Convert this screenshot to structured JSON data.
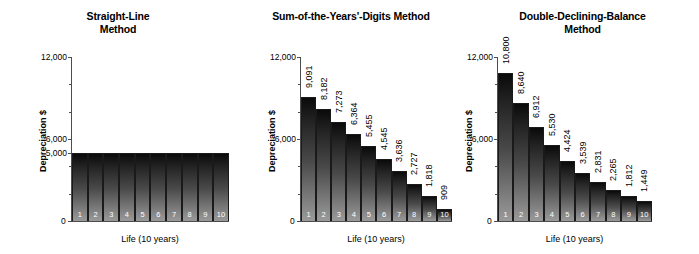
{
  "figure": {
    "panels": [
      {
        "title": "Straight-Line\nMethod",
        "ylabel": "Depreciation $",
        "xlabel": "Life (10 years)",
        "ytick_labels": [
          "12,000",
          "6,000",
          "5,000",
          "0"
        ],
        "zero_label": "0",
        "bar_labels": [
          "1",
          "2",
          "3",
          "4",
          "5",
          "6",
          "7",
          "8",
          "9",
          "10"
        ],
        "show_value_labels": false,
        "values_text": []
      },
      {
        "title": "Sum-of-the-Years'-Digits Method",
        "ylabel": "Depreciation $",
        "xlabel": "Life (10 years)",
        "ytick_labels": [
          "12,000",
          "6,000",
          "0"
        ],
        "zero_label": "0",
        "bar_labels": [
          "1",
          "2",
          "3",
          "4",
          "5",
          "6",
          "7",
          "8",
          "9",
          "10"
        ],
        "show_value_labels": true,
        "values_text": [
          "9,091",
          "8,182",
          "7,273",
          "6,364",
          "5,455",
          "4,545",
          "3,636",
          "2,727",
          "1,818",
          "909"
        ]
      },
      {
        "title": "Double-Declining-Balance\nMethod",
        "ylabel": "Depreciation $",
        "xlabel": "Life (10 years)",
        "ytick_labels": [
          "12,000",
          "6,000",
          "0"
        ],
        "zero_label": "0",
        "bar_labels": [
          "1",
          "2",
          "3",
          "4",
          "5",
          "6",
          "7",
          "8",
          "9",
          "10"
        ],
        "show_value_labels": true,
        "values_text": [
          "10,800",
          "8,640",
          "6,912",
          "5,530",
          "4,424",
          "3,539",
          "2,831",
          "2,265",
          "1,812",
          "1,449"
        ]
      }
    ]
  },
  "chart_data": [
    {
      "type": "bar",
      "title": "Straight-Line Method",
      "xlabel": "Life (10 years)",
      "ylabel": "Depreciation $",
      "categories": [
        "1",
        "2",
        "3",
        "4",
        "5",
        "6",
        "7",
        "8",
        "9",
        "10"
      ],
      "values": [
        5000,
        5000,
        5000,
        5000,
        5000,
        5000,
        5000,
        5000,
        5000,
        5000
      ],
      "ylim": [
        0,
        12000
      ],
      "yticks": [
        0,
        5000,
        6000,
        12000
      ],
      "ytick_labels": [
        "0",
        "5,000",
        "6,000",
        "12,000"
      ],
      "grid": false,
      "legend": "none",
      "data_labels_shown": false
    },
    {
      "type": "bar",
      "title": "Sum-of-the-Years'-Digits Method",
      "xlabel": "Life (10 years)",
      "ylabel": "Depreciation $",
      "categories": [
        "1",
        "2",
        "3",
        "4",
        "5",
        "6",
        "7",
        "8",
        "9",
        "10"
      ],
      "values": [
        9091,
        8182,
        7273,
        6364,
        5455,
        4545,
        3636,
        2727,
        1818,
        909
      ],
      "ylim": [
        0,
        12000
      ],
      "yticks": [
        0,
        6000,
        12000
      ],
      "ytick_labels": [
        "0",
        "6,000",
        "12,000"
      ],
      "grid": false,
      "legend": "none",
      "data_labels_shown": true
    },
    {
      "type": "bar",
      "title": "Double-Declining-Balance Method",
      "xlabel": "Life (10 years)",
      "ylabel": "Depreciation $",
      "categories": [
        "1",
        "2",
        "3",
        "4",
        "5",
        "6",
        "7",
        "8",
        "9",
        "10"
      ],
      "values": [
        10800,
        8640,
        6912,
        5530,
        4424,
        3539,
        2831,
        2265,
        1812,
        1449
      ],
      "ylim": [
        0,
        12000
      ],
      "yticks": [
        0,
        6000,
        12000
      ],
      "ytick_labels": [
        "0",
        "6,000",
        "12,000"
      ],
      "grid": false,
      "legend": "none",
      "data_labels_shown": true
    }
  ],
  "colors": {
    "bar_top": "#0a0a0a",
    "bar_bottom": "#9a9a9a",
    "axis": "#4d4d4d",
    "text": "#000000",
    "background": "#ffffff"
  }
}
